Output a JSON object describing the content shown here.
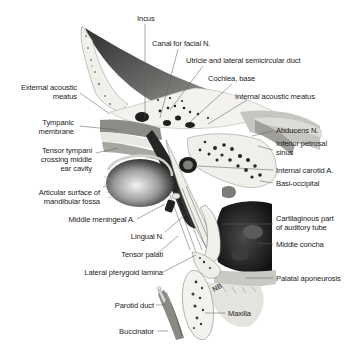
{
  "figure": {
    "colors": {
      "background": "#ffffff",
      "label_text": "#1c1c1c",
      "leader_line": "#6a6a6a",
      "bone_light": "#f2f1ec",
      "bone_shade": "#bdbcb6",
      "dark_tissue": "#1e1e1e",
      "mid_gray": "#7c7c7a"
    },
    "labels": {
      "incus": "Incus",
      "canal_facial": "Canal for facial N.",
      "utricle": "Utricle and lateral semicircular duct",
      "cochlea": "Cochlea, base",
      "internal_acoustic": "Internal acoustic meatus",
      "external_acoustic": [
        "External acoustic",
        "meatus"
      ],
      "tympanic": [
        "Tympanic",
        "membrane"
      ],
      "tensor_tympani": [
        "Tensor tympani",
        "crossing middle",
        "ear cavity"
      ],
      "articular": [
        "Articular surface of",
        "mandibular fossa"
      ],
      "middle_meningeal": "Middle meningeal A.",
      "lingual": "Lingual N.",
      "tensor_palati": "Tensor palati",
      "lateral_pterygoid": "Lateral pterygoid lamina",
      "parotid": "Parotid duct",
      "buccinator": "Buccinator",
      "abducens": "Abducens N.",
      "inferior_petrosal": [
        "Inferior petrosal",
        "sinus"
      ],
      "internal_carotid": "Internal carotid A.",
      "basi_occipital": "Basi-occipital",
      "cartilaginous": [
        "Cartilaginous part",
        "of auditory tube"
      ],
      "middle_concha": "Middle concha",
      "palatal": "Palatal aponeurosis",
      "maxilla": "Maxilla",
      "artist_initials": "NB"
    }
  }
}
